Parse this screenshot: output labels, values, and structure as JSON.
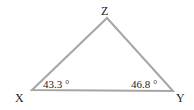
{
  "diagram": {
    "type": "triangle",
    "stroke_color": "#a6a6a6",
    "vertices": [
      {
        "name": "X",
        "label": "X"
      },
      {
        "name": "Y",
        "label": "Y"
      },
      {
        "name": "Z",
        "label": "Z"
      }
    ],
    "angles": [
      {
        "vertex": "X",
        "label": "43.3 °"
      },
      {
        "vertex": "Y",
        "label": "46.8 °"
      }
    ]
  }
}
